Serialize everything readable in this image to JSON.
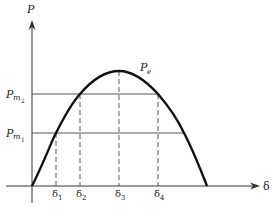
{
  "diagram": {
    "y_axis_label": "P",
    "x_axis_label": "δ",
    "curve_label": "P",
    "curve_label_sub": "e",
    "levels": [
      {
        "label": "P",
        "sub": "m",
        "subsub": "2"
      },
      {
        "label": "P",
        "sub": "m",
        "subsub": "1"
      }
    ],
    "angles": [
      {
        "label": "δ",
        "sub": "1"
      },
      {
        "label": "δ",
        "sub": "2"
      },
      {
        "label": "δ",
        "sub": "3"
      },
      {
        "label": "δ",
        "sub": "4"
      }
    ],
    "colors": {
      "curve": "#111111",
      "axes": "#333333",
      "guides": "#444444"
    }
  }
}
